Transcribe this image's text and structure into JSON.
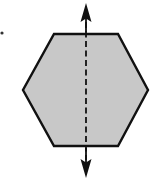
{
  "diagram": {
    "canvas": {
      "width": 158,
      "height": 181
    },
    "colors": {
      "background": "#ffffff",
      "hexagon_fill": "#c8c8c8",
      "hexagon_stroke": "#111111",
      "axis_stroke": "#111111",
      "marker": "#333333"
    },
    "hexagon": {
      "shape": "regular-hexagon",
      "points": [
        [
          54,
          34
        ],
        [
          118,
          34
        ],
        [
          148,
          90
        ],
        [
          118,
          146
        ],
        [
          54,
          146
        ],
        [
          23,
          90
        ]
      ]
    },
    "symmetry_line": {
      "style": "dashed",
      "x": 86,
      "y_start": 4,
      "y_end": 177,
      "arrows": [
        "up",
        "down"
      ]
    },
    "bullet_marker": {
      "x": 2,
      "y": 33
    }
  }
}
